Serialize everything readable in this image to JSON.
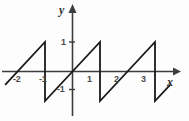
{
  "figure": {
    "width": 189,
    "height": 121,
    "background": "#fdfdfd",
    "stroke_color": "#1a1a1a",
    "axis_color": "#3d3d3d",
    "label_color": "#4a4a4a"
  },
  "axes": {
    "x_name": "x",
    "y_name": "y",
    "x_ticks": [
      {
        "label": "-2",
        "value": -2
      },
      {
        "label": "-1",
        "value": -1
      },
      {
        "label": "1",
        "value": 1
      },
      {
        "label": "2",
        "value": 2
      },
      {
        "label": "3",
        "value": 3
      }
    ],
    "y_ticks": [
      {
        "label": "1",
        "value": 1
      },
      {
        "label": "-1",
        "value": -1
      }
    ]
  },
  "chart_data": {
    "type": "line",
    "title": "",
    "subtitle": "",
    "xlabel": "x",
    "ylabel": "y",
    "xlim": [
      -2.5,
      3.8
    ],
    "ylim": [
      -1.45,
      1.45
    ],
    "grid": false,
    "legend": null,
    "period": 2,
    "amplitude": 1,
    "series": [
      {
        "name": "sawtooth",
        "points": [
          {
            "x": -2.45,
            "y": -0.45
          },
          {
            "x": -1.0,
            "y": 1.0
          },
          {
            "x": -1.0,
            "y": -1.0
          },
          {
            "x": 1.0,
            "y": 1.0
          },
          {
            "x": 1.0,
            "y": -1.0
          },
          {
            "x": 3.0,
            "y": 1.0
          },
          {
            "x": 3.0,
            "y": -1.0
          },
          {
            "x": 3.55,
            "y": -0.45
          }
        ]
      }
    ]
  }
}
